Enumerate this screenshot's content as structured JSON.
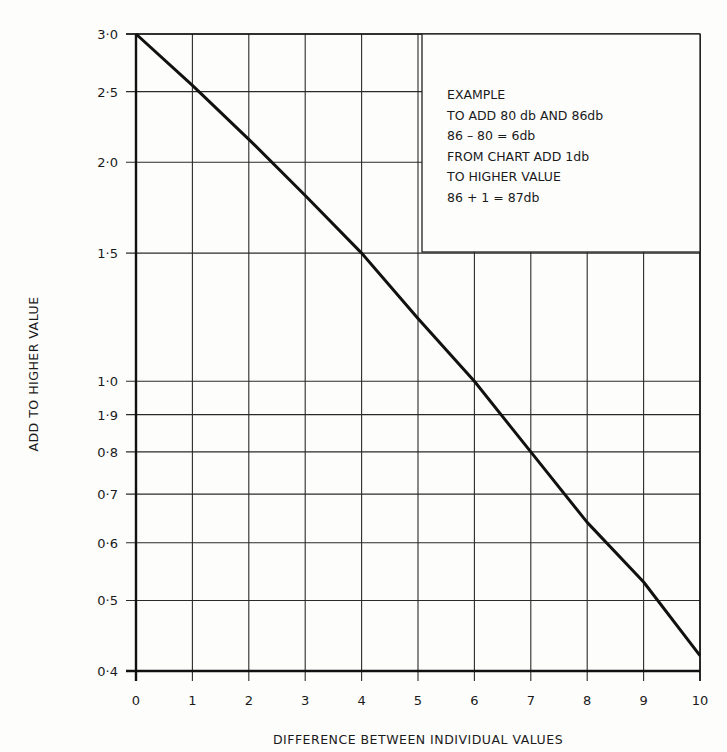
{
  "chart_data": {
    "type": "line",
    "title": "",
    "xlabel": "DIFFERENCE BETWEEN INDIVIDUAL VALUES",
    "ylabel": "ADD TO HIGHER VALUE",
    "xlim": [
      0,
      10
    ],
    "ylim": [
      0.4,
      3.0
    ],
    "y_scale": "log",
    "grid": true,
    "x_ticks": [
      0,
      1,
      2,
      3,
      4,
      5,
      6,
      7,
      8,
      9,
      10
    ],
    "x_tick_labels": [
      "0",
      "1",
      "2",
      "3",
      "4",
      "5",
      "6",
      "7",
      "8",
      "9",
      "10"
    ],
    "y_ticks": [
      3.0,
      2.5,
      2.0,
      1.5,
      1.0,
      0.9,
      0.8,
      0.7,
      0.6,
      0.5,
      0.4
    ],
    "y_tick_labels": [
      "3·0",
      "2·5",
      "2·0",
      "1·5",
      "1·0",
      "1·9",
      "0·8",
      "0·7",
      "0·6",
      "0·5",
      "0·4"
    ],
    "series": [
      {
        "name": "dB addition curve",
        "x": [
          0,
          1,
          2,
          3,
          4,
          5,
          6,
          7,
          8,
          9,
          10
        ],
        "y": [
          3.0,
          2.55,
          2.15,
          1.8,
          1.5,
          1.22,
          1.0,
          0.8,
          0.64,
          0.53,
          0.42
        ]
      }
    ],
    "annotation": {
      "lines": [
        "EXAMPLE",
        "TO ADD 80 db AND 86db",
        "86 – 80 = 6db",
        "FROM CHART ADD 1db",
        "TO HIGHER VALUE",
        "86 + 1 = 87db"
      ],
      "position": "top-right"
    }
  }
}
